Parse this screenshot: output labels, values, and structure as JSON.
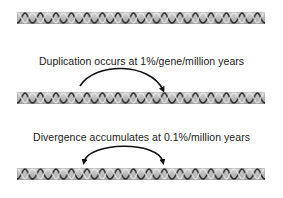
{
  "diagram": {
    "type": "gene-duplication-and-divergence",
    "rows": [
      {
        "id": "original-chromosome",
        "element": "dna-helix-strip"
      },
      {
        "id": "after-duplication",
        "caption": "Duplication occurs at 1%/gene/million years",
        "element": "dna-helix-strip",
        "arrow": "curved-arrow-single-head"
      },
      {
        "id": "after-divergence",
        "caption": "Divergence accumulates at 0.1%/million years",
        "element": "dna-helix-strip",
        "arrow": "curved-arrow-double-head"
      }
    ],
    "colors": {
      "strip_fill": "#b8b8b8",
      "strip_border": "#8a8a8a",
      "helix_strand": "#2a2a2a",
      "helix_highlight": "#e8e8e8",
      "arrow": "#111111",
      "text": "#1a1a1a"
    }
  }
}
